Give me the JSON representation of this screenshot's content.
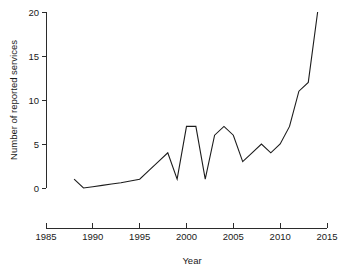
{
  "chart_data": {
    "type": "line",
    "title": "",
    "xlabel": "Year",
    "ylabel": "Number of reported services",
    "xlim": [
      1985,
      2015
    ],
    "ylim": [
      0,
      20
    ],
    "grid": false,
    "legend": null,
    "x_ticks": [
      1985,
      1990,
      1995,
      2000,
      2005,
      2010,
      2015
    ],
    "y_ticks": [
      0,
      5,
      10,
      15,
      20
    ],
    "x_tick_labels": [
      "1985",
      "1990",
      "1995",
      "2000",
      "2005",
      "2010",
      "2015"
    ],
    "y_tick_labels": [
      "0",
      "5",
      "10",
      "15",
      "20"
    ],
    "series": [
      {
        "name": "Reported services",
        "color": "#1c1c1c",
        "x": [
          1988,
          1989,
          1990,
          1991,
          1992,
          1993,
          1994,
          1995,
          1996,
          1997,
          1998,
          1999,
          2000,
          2001,
          2002,
          2003,
          2004,
          2005,
          2006,
          2007,
          2008,
          2009,
          2010,
          2011,
          2012,
          2013,
          2014
        ],
        "values": [
          1,
          0,
          0.15,
          0.3,
          0.45,
          0.6,
          0.8,
          1,
          2,
          3,
          4,
          1,
          7,
          7,
          1,
          6,
          7,
          6,
          3,
          4,
          5,
          4,
          5,
          7,
          11,
          12,
          20
        ]
      }
    ]
  },
  "axis_labels": {
    "x_title": "Year",
    "y_title": "Number of reported services"
  }
}
